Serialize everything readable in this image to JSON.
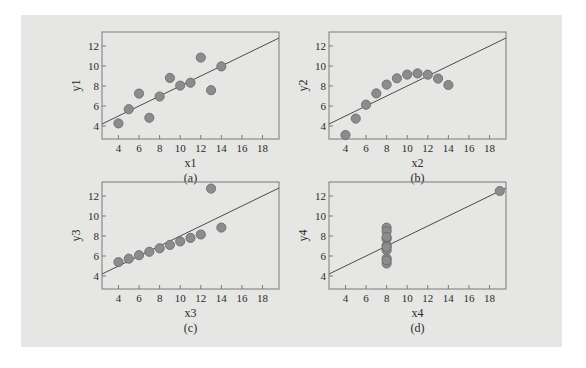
{
  "figure": {
    "background_color": "#e6e6e4",
    "frame_color": "#7a7a7a",
    "marker_fill": "#8c8c8c",
    "marker_stroke": "#666666",
    "line_color": "#4a4a4a"
  },
  "chart_data": [
    {
      "type": "scatter",
      "panel": "a",
      "caption": "(a)",
      "xlabel": "x1",
      "ylabel": "y1",
      "xlim": [
        2.4,
        19.6
      ],
      "ylim": [
        2.7,
        13.4
      ],
      "xticks": [
        4,
        6,
        8,
        10,
        12,
        14,
        16,
        18
      ],
      "yticks": [
        4,
        6,
        8,
        10,
        12
      ],
      "grid": false,
      "x": [
        10,
        8,
        13,
        9,
        11,
        14,
        6,
        4,
        12,
        7,
        5
      ],
      "y": [
        8.04,
        6.95,
        7.58,
        8.81,
        8.33,
        9.96,
        7.24,
        4.26,
        10.84,
        4.82,
        5.68
      ],
      "fit_line": {
        "intercept": 3.0,
        "slope": 0.5
      }
    },
    {
      "type": "scatter",
      "panel": "b",
      "caption": "(b)",
      "xlabel": "x2",
      "ylabel": "y2",
      "xlim": [
        2.4,
        19.6
      ],
      "ylim": [
        2.7,
        13.4
      ],
      "xticks": [
        4,
        6,
        8,
        10,
        12,
        14,
        16,
        18
      ],
      "yticks": [
        4,
        6,
        8,
        10,
        12
      ],
      "grid": false,
      "x": [
        10,
        8,
        13,
        9,
        11,
        14,
        6,
        4,
        12,
        7,
        5
      ],
      "y": [
        9.14,
        8.14,
        8.74,
        8.77,
        9.26,
        8.1,
        6.13,
        3.1,
        9.13,
        7.26,
        4.74
      ],
      "fit_line": {
        "intercept": 3.0,
        "slope": 0.5
      }
    },
    {
      "type": "scatter",
      "panel": "c",
      "caption": "(c)",
      "xlabel": "x3",
      "ylabel": "y3",
      "xlim": [
        2.4,
        19.6
      ],
      "ylim": [
        2.7,
        13.4
      ],
      "xticks": [
        4,
        6,
        8,
        10,
        12,
        14,
        16,
        18
      ],
      "yticks": [
        4,
        6,
        8,
        10,
        12
      ],
      "grid": false,
      "x": [
        10,
        8,
        13,
        9,
        11,
        14,
        6,
        4,
        12,
        7,
        5
      ],
      "y": [
        7.46,
        6.77,
        12.74,
        7.11,
        7.81,
        8.84,
        6.08,
        5.39,
        8.15,
        6.42,
        5.73
      ],
      "fit_line": {
        "intercept": 3.0,
        "slope": 0.5
      }
    },
    {
      "type": "scatter",
      "panel": "d",
      "caption": "(d)",
      "xlabel": "x4",
      "ylabel": "y4",
      "xlim": [
        2.4,
        19.6
      ],
      "ylim": [
        2.7,
        13.4
      ],
      "xticks": [
        4,
        6,
        8,
        10,
        12,
        14,
        16,
        18
      ],
      "yticks": [
        4,
        6,
        8,
        10,
        12
      ],
      "grid": false,
      "x": [
        8,
        8,
        8,
        8,
        8,
        8,
        8,
        19,
        8,
        8,
        8
      ],
      "y": [
        6.58,
        5.76,
        7.71,
        8.84,
        8.47,
        7.04,
        5.25,
        12.5,
        5.56,
        7.91,
        6.89
      ],
      "fit_line": {
        "intercept": 3.0,
        "slope": 0.5
      }
    }
  ]
}
